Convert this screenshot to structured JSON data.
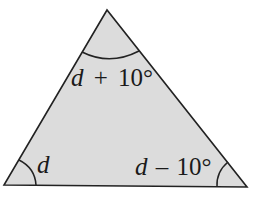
{
  "diagram": {
    "type": "triangle",
    "fill_color": "#dcdcdc",
    "stroke_color": "#222222",
    "vertices": {
      "top": [
        107,
        10
      ],
      "bottom_left": [
        4,
        185
      ],
      "bottom_right": [
        247,
        187
      ]
    },
    "angles": {
      "top": {
        "variable": "d",
        "operator": "+",
        "value": "10°",
        "full": "d + 10°"
      },
      "bottom_left": {
        "variable": "d",
        "full": "d"
      },
      "bottom_right": {
        "variable": "d",
        "operator": "–",
        "value": "10°",
        "full": "d – 10°"
      }
    }
  }
}
